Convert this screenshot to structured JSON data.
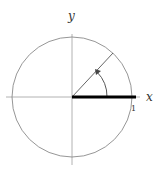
{
  "diagram": {
    "x_axis_label": "x",
    "y_axis_label": "y",
    "unit_label": "1",
    "colors": {
      "circle": "#8a8a8a",
      "axes": "#9a9a9a",
      "radius_segment": "#000000",
      "text": "#333333"
    }
  }
}
